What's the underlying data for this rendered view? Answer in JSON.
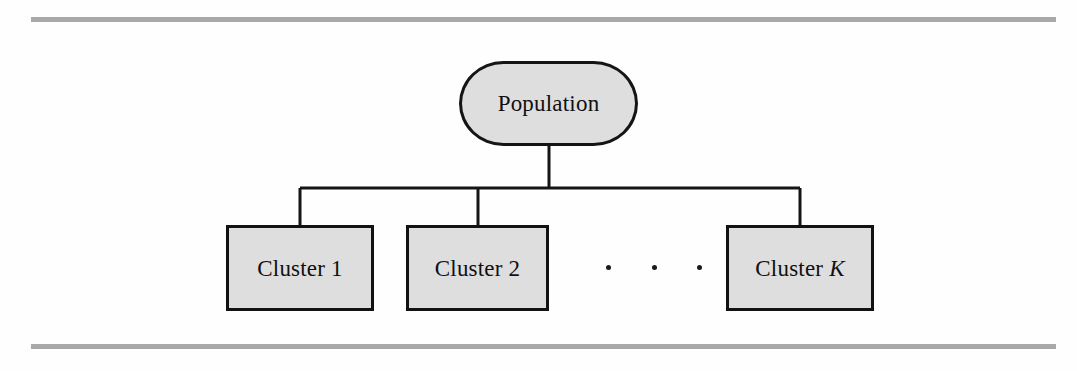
{
  "figure": {
    "type": "hierarchy-diagram",
    "background_color": "#fefefe",
    "rules": {
      "color": "#a9a9ac",
      "top_label": "top-rule",
      "bottom_label": "bottom-rule"
    },
    "node_fill": "#dedede",
    "node_stroke": "#121212",
    "root": {
      "label": "Population",
      "shape": "cylinder"
    },
    "children": [
      {
        "label": "Cluster 1",
        "shape": "rectangle"
      },
      {
        "label": "Cluster 2",
        "shape": "rectangle"
      },
      {
        "label_prefix": "Cluster ",
        "label_italic": "K",
        "shape": "rectangle"
      }
    ],
    "ellipsis": {
      "text": ". . .",
      "dot_count": 3
    },
    "connectors": {
      "stem_from_root": true,
      "bus_y": 188,
      "branch_count": 3
    }
  }
}
